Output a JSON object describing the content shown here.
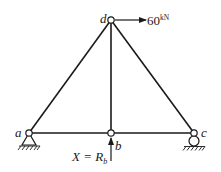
{
  "diagram": {
    "nodes": [
      {
        "id": "a",
        "label": "a",
        "support": "pin"
      },
      {
        "id": "b",
        "label": "b",
        "support": "none"
      },
      {
        "id": "c",
        "label": "c",
        "support": "roller"
      },
      {
        "id": "d",
        "label": "d",
        "support": "none"
      }
    ],
    "members": [
      {
        "from": "a",
        "to": "b"
      },
      {
        "from": "b",
        "to": "c"
      },
      {
        "from": "a",
        "to": "d"
      },
      {
        "from": "b",
        "to": "d"
      },
      {
        "from": "c",
        "to": "d"
      }
    ],
    "load": {
      "node": "d",
      "direction": "right",
      "value": "60",
      "unit": "kN"
    },
    "redundant": {
      "node": "b",
      "direction": "up",
      "label_lhs": "X = R",
      "label_sub": "b"
    }
  }
}
